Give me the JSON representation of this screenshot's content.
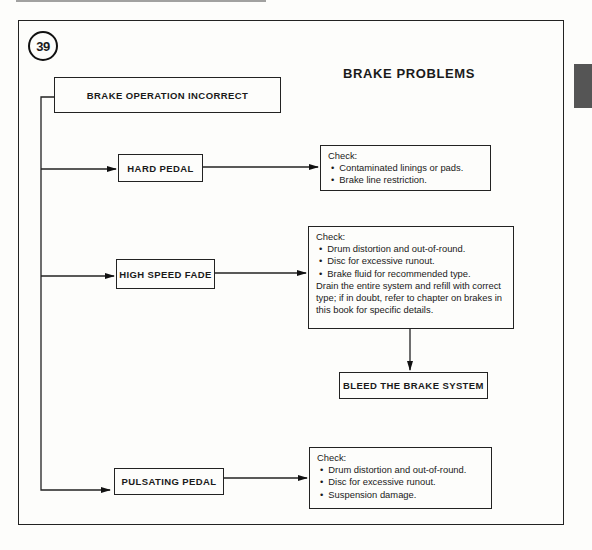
{
  "figure": {
    "number": "39",
    "title": "BRAKE PROBLEMS"
  },
  "root": {
    "label": "BRAKE OPERATION INCORRECT"
  },
  "problems": [
    {
      "label": "HARD PEDAL",
      "check": {
        "heading": "Check:",
        "items": [
          "Contaminated linings or pads.",
          "Brake line restriction."
        ]
      }
    },
    {
      "label": "HIGH SPEED FADE",
      "check": {
        "heading": "Check:",
        "items": [
          "Drum distortion and out-of-round.",
          "Disc for excessive runout.",
          "Brake fluid for recommended type."
        ],
        "note": "Drain the entire system and refill with correct type; if in doubt, refer to chapter on brakes in this book for specific details."
      },
      "next_step": "BLEED THE BRAKE SYSTEM"
    },
    {
      "label": "PULSATING PEDAL",
      "check": {
        "heading": "Check:",
        "items": [
          "Drum distortion and out-of-round.",
          "Disc for excessive runout.",
          "Suspension damage."
        ]
      }
    }
  ]
}
